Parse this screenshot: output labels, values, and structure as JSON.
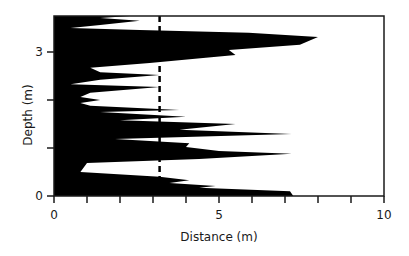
{
  "chart_data": {
    "type": "area",
    "title": "",
    "xlabel": "Distance (m)",
    "ylabel": "Depth (m)",
    "xlim": [
      0,
      10
    ],
    "ylim": [
      0,
      3.75
    ],
    "x_ticks": [
      0,
      1,
      2,
      3,
      4,
      5,
      6,
      7,
      8,
      9,
      10
    ],
    "x_tick_labels": [
      {
        "value": 0,
        "label": "0"
      },
      {
        "value": 5,
        "label": "5"
      },
      {
        "value": 10,
        "label": "10"
      }
    ],
    "y_ticks": [
      0,
      1,
      2,
      3
    ],
    "y_tick_labels": [
      {
        "value": 0,
        "label": "0"
      },
      {
        "value": 3,
        "label": "3"
      }
    ],
    "grid": false,
    "legend": null,
    "fill_color": "#000000",
    "reference_line": {
      "orientation": "vertical",
      "x": 3.2,
      "style": "dashed",
      "color": "#000000"
    },
    "series": [
      {
        "name": "profile",
        "orientation": "horizontal",
        "points": [
          {
            "depth": 0.0,
            "distance": 7.25
          },
          {
            "depth": 0.1,
            "distance": 7.15
          },
          {
            "depth": 0.17,
            "distance": 4.4
          },
          {
            "depth": 0.21,
            "distance": 4.9
          },
          {
            "depth": 0.27,
            "distance": 3.5
          },
          {
            "depth": 0.33,
            "distance": 4.1
          },
          {
            "depth": 0.4,
            "distance": 3.2
          },
          {
            "depth": 0.5,
            "distance": 0.8
          },
          {
            "depth": 0.69,
            "distance": 1.0
          },
          {
            "depth": 0.77,
            "distance": 4.4
          },
          {
            "depth": 0.88,
            "distance": 7.2
          },
          {
            "depth": 0.94,
            "distance": 5.0
          },
          {
            "depth": 1.02,
            "distance": 4.0
          },
          {
            "depth": 1.1,
            "distance": 4.1
          },
          {
            "depth": 1.19,
            "distance": 1.85
          },
          {
            "depth": 1.29,
            "distance": 7.2
          },
          {
            "depth": 1.38,
            "distance": 3.8
          },
          {
            "depth": 1.5,
            "distance": 5.5
          },
          {
            "depth": 1.58,
            "distance": 2.0
          },
          {
            "depth": 1.65,
            "distance": 4.0
          },
          {
            "depth": 1.75,
            "distance": 1.4
          },
          {
            "depth": 1.79,
            "distance": 3.8
          },
          {
            "depth": 1.88,
            "distance": 1.1
          },
          {
            "depth": 1.94,
            "distance": 0.8
          },
          {
            "depth": 2.0,
            "distance": 1.4
          },
          {
            "depth": 2.06,
            "distance": 0.8
          },
          {
            "depth": 2.15,
            "distance": 1.1
          },
          {
            "depth": 2.27,
            "distance": 3.2
          },
          {
            "depth": 2.33,
            "distance": 0.5
          },
          {
            "depth": 2.42,
            "distance": 1.4
          },
          {
            "depth": 2.52,
            "distance": 3.2
          },
          {
            "depth": 2.58,
            "distance": 1.4
          },
          {
            "depth": 2.67,
            "distance": 1.1
          },
          {
            "depth": 2.77,
            "distance": 2.9
          },
          {
            "depth": 2.88,
            "distance": 4.6
          },
          {
            "depth": 2.94,
            "distance": 5.5
          },
          {
            "depth": 3.04,
            "distance": 5.3
          },
          {
            "depth": 3.15,
            "distance": 7.45
          },
          {
            "depth": 3.31,
            "distance": 8.0
          },
          {
            "depth": 3.4,
            "distance": 5.9
          },
          {
            "depth": 3.46,
            "distance": 2.6
          },
          {
            "depth": 3.5,
            "distance": 0.5
          },
          {
            "depth": 3.56,
            "distance": 1.4
          },
          {
            "depth": 3.65,
            "distance": 2.6
          },
          {
            "depth": 3.71,
            "distance": 1.4
          },
          {
            "depth": 3.75,
            "distance": 2.3
          }
        ]
      }
    ]
  }
}
